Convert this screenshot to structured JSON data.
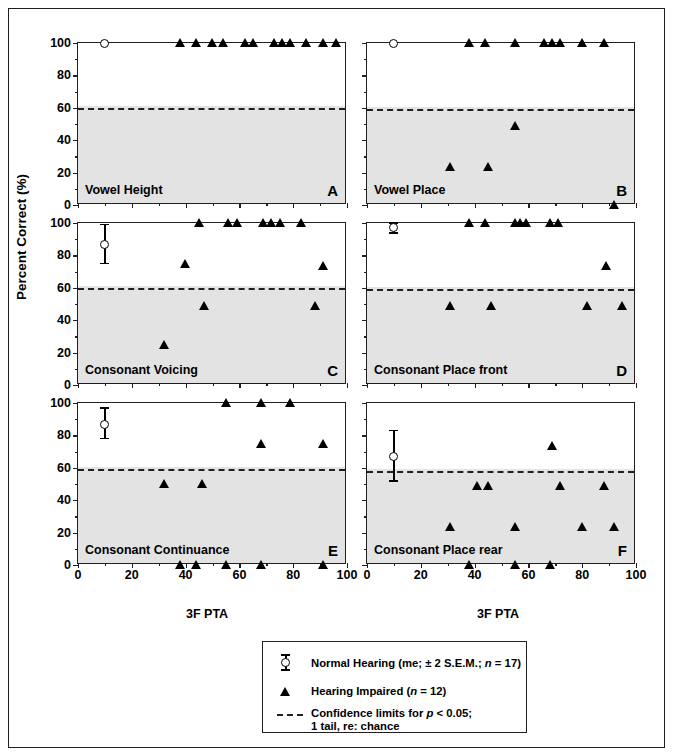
{
  "figure": {
    "y_axis_label": "Percent Correct (%)",
    "x_axis_label": "3F PTA",
    "y_ticks": [
      "0",
      "20",
      "40",
      "60",
      "80",
      "100"
    ],
    "x_ticks": [
      "0",
      "20",
      "40",
      "60",
      "80",
      "100"
    ]
  },
  "legend": {
    "normal_hearing": "Normal Hearing (me; ± 2 S.E.M.; n = 17)",
    "normal_hearing_pre": "Normal Hearing (me; ± 2 S.E.M.; ",
    "normal_hearing_n": "n",
    "normal_hearing_post": " = 17)",
    "hearing_impaired_pre": "Hearing Impaired (",
    "hearing_impaired_n": "n",
    "hearing_impaired_post": " = 12)",
    "conf_pre": "Confidence limits for ",
    "conf_p": "p",
    "conf_post": " < 0.05;",
    "conf_line2": "1 tail, re: chance"
  },
  "chart_data": {
    "type": "scatter",
    "xlabel": "3F PTA",
    "ylabel": "Percent Correct (%)",
    "xlim": [
      0,
      100
    ],
    "ylim": [
      0,
      100
    ],
    "grid": false,
    "shaded_region_note": "Grey shading below the chance confidence limit",
    "legend_position": "below figure, centered",
    "series_styles": {
      "normal_hearing": {
        "marker": "open-circle",
        "errorbars": "±2 S.E.M.",
        "n": 17
      },
      "hearing_impaired": {
        "marker": "filled-triangle",
        "n": 12
      },
      "confidence_limit": {
        "style": "dashed",
        "color": "#231f20"
      }
    },
    "panels": [
      {
        "letter": "A",
        "title": "Vowel Height",
        "chance_limit": 60,
        "normal": [
          {
            "x": 10,
            "y": 100,
            "err_low": 100,
            "err_high": 100
          }
        ],
        "impaired": [
          {
            "x": 38,
            "y": 100
          },
          {
            "x": 44,
            "y": 100
          },
          {
            "x": 50,
            "y": 100
          },
          {
            "x": 54,
            "y": 100
          },
          {
            "x": 62,
            "y": 100
          },
          {
            "x": 65,
            "y": 100
          },
          {
            "x": 73,
            "y": 100
          },
          {
            "x": 76,
            "y": 100
          },
          {
            "x": 79,
            "y": 100
          },
          {
            "x": 85,
            "y": 100
          },
          {
            "x": 91,
            "y": 100
          },
          {
            "x": 96,
            "y": 100
          }
        ]
      },
      {
        "letter": "B",
        "title": "Vowel Place",
        "chance_limit": 59,
        "normal": [
          {
            "x": 10,
            "y": 100,
            "err_low": 100,
            "err_high": 100
          }
        ],
        "impaired": [
          {
            "x": 38,
            "y": 100
          },
          {
            "x": 44,
            "y": 100
          },
          {
            "x": 55,
            "y": 100
          },
          {
            "x": 66,
            "y": 100
          },
          {
            "x": 69,
            "y": 100
          },
          {
            "x": 72,
            "y": 100
          },
          {
            "x": 80,
            "y": 100
          },
          {
            "x": 88,
            "y": 100
          },
          {
            "x": 55,
            "y": 49
          },
          {
            "x": 31,
            "y": 24
          },
          {
            "x": 45,
            "y": 24
          },
          {
            "x": 92,
            "y": 0
          }
        ]
      },
      {
        "letter": "C",
        "title": "Consonant Voicing",
        "chance_limit": 60,
        "normal": [
          {
            "x": 10,
            "y": 87,
            "err_low": 75,
            "err_high": 99
          }
        ],
        "impaired": [
          {
            "x": 45,
            "y": 100
          },
          {
            "x": 56,
            "y": 100
          },
          {
            "x": 59,
            "y": 100
          },
          {
            "x": 69,
            "y": 100
          },
          {
            "x": 72,
            "y": 100
          },
          {
            "x": 75,
            "y": 100
          },
          {
            "x": 83,
            "y": 100
          },
          {
            "x": 40,
            "y": 75
          },
          {
            "x": 91,
            "y": 74
          },
          {
            "x": 47,
            "y": 49
          },
          {
            "x": 88,
            "y": 49
          },
          {
            "x": 32,
            "y": 25
          }
        ]
      },
      {
        "letter": "D",
        "title": "Consonant Place front",
        "chance_limit": 59,
        "normal": [
          {
            "x": 10,
            "y": 97,
            "err_low": 94,
            "err_high": 100
          }
        ],
        "impaired": [
          {
            "x": 38,
            "y": 100
          },
          {
            "x": 44,
            "y": 100
          },
          {
            "x": 55,
            "y": 100
          },
          {
            "x": 57,
            "y": 100
          },
          {
            "x": 59,
            "y": 100
          },
          {
            "x": 68,
            "y": 100
          },
          {
            "x": 71,
            "y": 100
          },
          {
            "x": 89,
            "y": 74
          },
          {
            "x": 31,
            "y": 49
          },
          {
            "x": 46,
            "y": 49
          },
          {
            "x": 82,
            "y": 49
          },
          {
            "x": 95,
            "y": 49
          }
        ]
      },
      {
        "letter": "E",
        "title": "Consonant Continuance",
        "chance_limit": 59,
        "normal": [
          {
            "x": 10,
            "y": 87,
            "err_low": 78,
            "err_high": 97
          }
        ],
        "impaired": [
          {
            "x": 55,
            "y": 100
          },
          {
            "x": 68,
            "y": 100
          },
          {
            "x": 79,
            "y": 100
          },
          {
            "x": 68,
            "y": 75
          },
          {
            "x": 91,
            "y": 75
          },
          {
            "x": 32,
            "y": 50
          },
          {
            "x": 46,
            "y": 50
          },
          {
            "x": 38,
            "y": 0
          },
          {
            "x": 44,
            "y": 0
          },
          {
            "x": 55,
            "y": 0
          },
          {
            "x": 68,
            "y": 0
          },
          {
            "x": 91,
            "y": 0
          }
        ]
      },
      {
        "letter": "F",
        "title": "Consonant Place rear",
        "chance_limit": 58,
        "normal": [
          {
            "x": 10,
            "y": 67,
            "err_low": 52,
            "err_high": 83
          }
        ],
        "impaired": [
          {
            "x": 69,
            "y": 74
          },
          {
            "x": 41,
            "y": 49
          },
          {
            "x": 45,
            "y": 49
          },
          {
            "x": 72,
            "y": 49
          },
          {
            "x": 88,
            "y": 49
          },
          {
            "x": 31,
            "y": 24
          },
          {
            "x": 55,
            "y": 24
          },
          {
            "x": 80,
            "y": 24
          },
          {
            "x": 92,
            "y": 24
          },
          {
            "x": 38,
            "y": 0
          },
          {
            "x": 55,
            "y": 0
          },
          {
            "x": 68,
            "y": 0
          }
        ]
      }
    ]
  }
}
